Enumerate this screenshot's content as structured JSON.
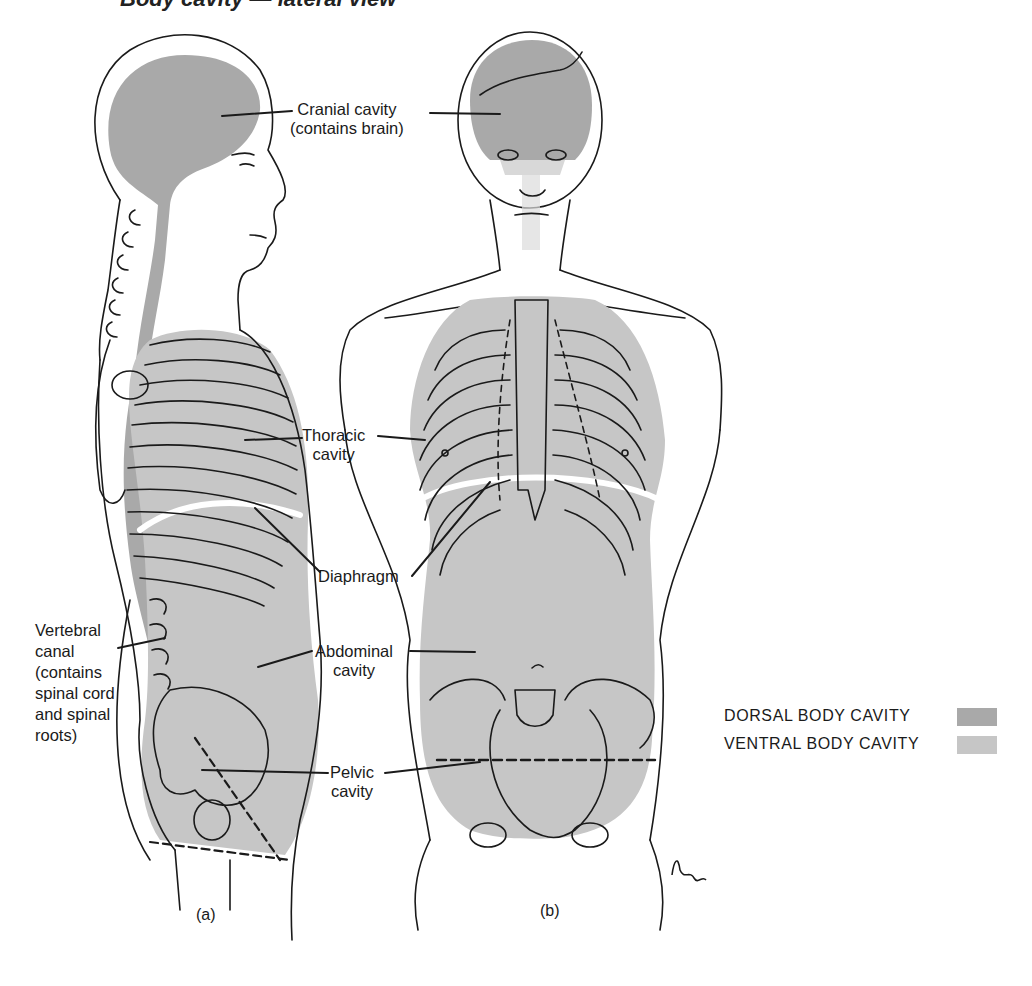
{
  "figure": {
    "title_partial": "Body cavity — lateral view",
    "panels": [
      {
        "id": "a",
        "caption": "(a)",
        "view": "lateral"
      },
      {
        "id": "b",
        "caption": "(b)",
        "view": "anterior"
      }
    ],
    "artist_signature": "Dohn"
  },
  "labels": {
    "cranial": {
      "line1": "Cranial cavity",
      "line2": "(contains brain)"
    },
    "thoracic": {
      "line1": "Thoracic",
      "line2": "cavity"
    },
    "diaphragm": {
      "line1": "Diaphragm"
    },
    "abdominal": {
      "line1": "Abdominal",
      "line2": "cavity"
    },
    "pelvic": {
      "line1": "Pelvic",
      "line2": "cavity"
    },
    "vertebral": {
      "line1": "Vertebral",
      "line2": "canal",
      "line3": "(contains",
      "line4": "spinal cord",
      "line5": "and spinal",
      "line6": "roots)"
    }
  },
  "legend": {
    "items": [
      {
        "label": "DORSAL BODY CAVITY",
        "color": "#a9a9a9"
      },
      {
        "label": "VENTRAL BODY CAVITY",
        "color": "#c6c6c6"
      }
    ]
  },
  "colors": {
    "dorsal": "#a9a9a9",
    "ventral": "#c6c6c6",
    "line": "#1a1a1a"
  }
}
